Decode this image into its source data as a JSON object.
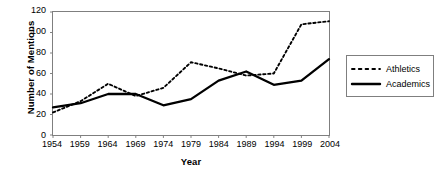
{
  "chart_data": {
    "type": "line",
    "title": "",
    "xlabel": "Year",
    "ylabel": "Number of Mentions",
    "x": [
      1954,
      1959,
      1964,
      1969,
      1974,
      1979,
      1984,
      1989,
      1994,
      1999,
      2004
    ],
    "xtick_labels": [
      "1954",
      "1959",
      "1964",
      "1969",
      "1974",
      "1979",
      "1984",
      "1989",
      "1994",
      "1999",
      "2004"
    ],
    "ytick_labels": [
      "0",
      "20",
      "40",
      "60",
      "80",
      "100",
      "120"
    ],
    "ytick_values": [
      0,
      20,
      40,
      60,
      80,
      100,
      120
    ],
    "xlim": [
      1954,
      2004
    ],
    "ylim": [
      0,
      120
    ],
    "grid": false,
    "legend_position": "right",
    "series": [
      {
        "name": "Athletics",
        "style": "dotted",
        "color": "#000000",
        "values": [
          22,
          33,
          50,
          38,
          46,
          71,
          65,
          58,
          60,
          108,
          111
        ]
      },
      {
        "name": "Academics",
        "style": "solid",
        "color": "#000000",
        "values": [
          27,
          31,
          40,
          40,
          29,
          35,
          53,
          62,
          49,
          53,
          74
        ]
      }
    ]
  },
  "legend": {
    "items": [
      {
        "label": "Athletics",
        "style": "dotted"
      },
      {
        "label": "Academics",
        "style": "solid"
      }
    ]
  },
  "axes": {
    "y_title": "Number of Mentions",
    "x_title": "Year"
  },
  "colors": {
    "line": "#000000",
    "frame": "#7f7f7f",
    "background": "#ffffff"
  }
}
